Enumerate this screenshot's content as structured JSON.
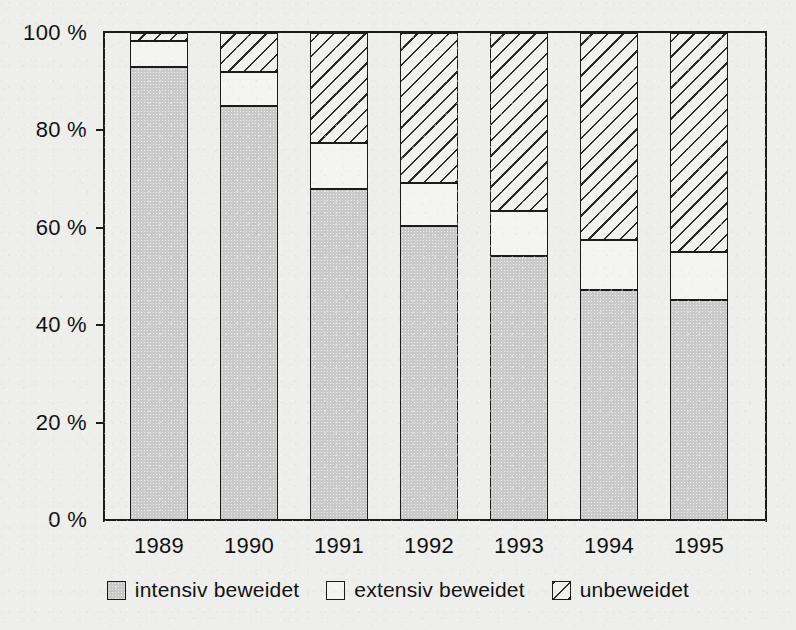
{
  "chart_data": {
    "type": "bar",
    "stacked": true,
    "stack_mode": "percent",
    "title": "",
    "subtitle": "",
    "xlabel": "",
    "ylabel": "",
    "categories": [
      "1989",
      "1990",
      "1991",
      "1992",
      "1993",
      "1994",
      "1995"
    ],
    "series": [
      {
        "name": "intensiv beweidet",
        "key": "intensiv",
        "fill": "gray-stipple",
        "color": "#c9c9c9",
        "values": [
          93.0,
          85.0,
          68.0,
          60.4,
          54.2,
          47.2,
          45.2
        ]
      },
      {
        "name": "extensiv beweidet",
        "key": "extensiv",
        "fill": "white",
        "color": "#f4f4f2",
        "values": [
          5.4,
          7.0,
          9.4,
          8.8,
          9.2,
          10.3,
          9.8
        ]
      },
      {
        "name": "unbeweidet",
        "key": "unbeweidet",
        "fill": "diagonal-hatch",
        "color": "#f1f1ef",
        "values": [
          1.6,
          8.0,
          22.6,
          30.8,
          36.6,
          42.5,
          45.0
        ]
      }
    ],
    "ylim": [
      0,
      100
    ],
    "yticks": [
      0,
      20,
      40,
      60,
      80,
      100
    ],
    "ytick_labels": [
      "0 %",
      "20 %",
      "40 %",
      "60 %",
      "80 %",
      "100 %"
    ],
    "grid": false,
    "legend_position": "bottom-center",
    "legend_entries": [
      "intensiv beweidet",
      "extensiv beweidet",
      "unbeweidet"
    ]
  },
  "axis": {
    "y_labels": [
      "100 %",
      "80 %",
      "60 %",
      "40 %",
      "20 %",
      "0 %"
    ],
    "x_labels": [
      "1989",
      "1990",
      "1991",
      "1992",
      "1993",
      "1994",
      "1995"
    ]
  },
  "legend": {
    "items": [
      {
        "label": "intensiv beweidet",
        "swatch": "gray"
      },
      {
        "label": "extensiv beweidet",
        "swatch": "white"
      },
      {
        "label": "unbeweidet",
        "swatch": "hatched"
      }
    ]
  },
  "colors": {
    "background": "#eeeeec",
    "ink": "#1b1b1b",
    "intensiv": "#c9c9c9",
    "extensiv": "#f4f4f2",
    "unbeweidet": "#f1f1ef"
  }
}
